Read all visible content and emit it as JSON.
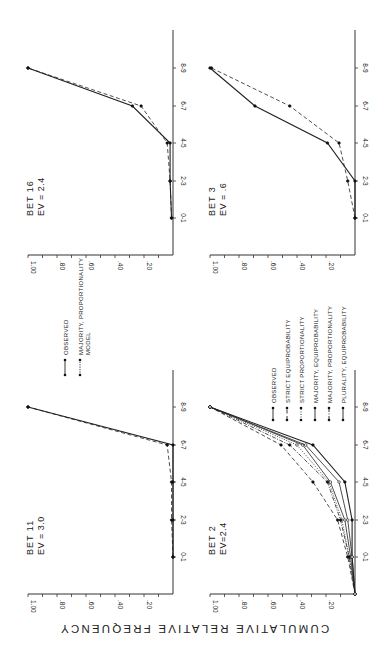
{
  "figure": {
    "ylabel": "CUMULATIVE  RELATIVE  FREQUENCY",
    "rotation": "figure rotated 90 degrees counter-clockwise on page"
  },
  "chart_data": [
    {
      "type": "line",
      "id": "bet11",
      "title": "BET 11",
      "subtitle": "EV = 3.0",
      "categories": [
        "0-1",
        "2-3",
        "4-5",
        "6-7",
        "8-9"
      ],
      "ylabel": "CUMULATIVE RELATIVE FREQUENCY",
      "yticks": [
        ".20",
        ".40",
        ".60",
        ".80",
        "1.00"
      ],
      "ylim": [
        0,
        1.0
      ],
      "legend": [
        "OBSERVED",
        "MAJORITY, PROPORTIONALITY MODEL"
      ],
      "series": [
        {
          "name": "OBSERVED",
          "style": "solid",
          "values": [
            0.0,
            0.0,
            0.0,
            0.0,
            1.0
          ]
        },
        {
          "name": "MAJORITY, PROPORTIONALITY MODEL",
          "style": "dashed",
          "values": [
            0.0,
            0.01,
            0.01,
            0.04,
            1.0
          ]
        }
      ]
    },
    {
      "type": "line",
      "id": "bet16",
      "title": "BET 16",
      "subtitle": "EV = 2.4",
      "categories": [
        "0-1",
        "2-3",
        "4-5",
        "6-7",
        "8-9"
      ],
      "yticks": [
        ".20",
        ".40",
        ".60",
        ".80",
        "1.00"
      ],
      "ylim": [
        0,
        1.0
      ],
      "series": [
        {
          "name": "OBSERVED",
          "style": "solid",
          "values": [
            0.01,
            0.02,
            0.02,
            0.28,
            1.0
          ]
        },
        {
          "name": "MAJORITY, PROPORTIONALITY MODEL",
          "style": "dashed",
          "values": [
            0.01,
            0.02,
            0.04,
            0.22,
            1.0
          ]
        }
      ]
    },
    {
      "type": "line",
      "id": "bet2",
      "title": "BET 2",
      "subtitle": "EV=2.4",
      "categories": [
        "",
        "0-1",
        "2-3",
        "4-5",
        "6-7",
        "8-9"
      ],
      "yticks": [
        ".20",
        ".40",
        ".60",
        ".80",
        "1.00"
      ],
      "ylim": [
        0,
        1.0
      ],
      "legend": [
        "OBSERVED",
        "STRICT EQUIPROBABILITY",
        "STRICT PROPORTIONALITY",
        "MAJORITY, EQUIPROBABILITY",
        "MAJORITY, PROPORTIONALITY",
        "PLURALITY, EQUIPROBABILITY"
      ],
      "series": [
        {
          "name": "OBSERVED",
          "style": "solid",
          "values": [
            0.0,
            0.02,
            0.02,
            0.07,
            0.29,
            1.0
          ]
        },
        {
          "name": "STRICT EQUIPROBABILITY",
          "style": "dashed",
          "values": [
            0.0,
            0.05,
            0.12,
            0.29,
            0.51,
            1.0
          ]
        },
        {
          "name": "STRICT PROPORTIONALITY",
          "style": "dotted",
          "values": [
            0.0,
            0.04,
            0.09,
            0.18,
            0.4,
            1.0
          ]
        },
        {
          "name": "MAJORITY, EQUIPROBABILITY",
          "style": "solid-open",
          "values": [
            0.0,
            0.03,
            0.07,
            0.17,
            0.36,
            1.0
          ]
        },
        {
          "name": "MAJORITY, PROPORTIONALITY",
          "style": "dash-dot",
          "values": [
            0.0,
            0.04,
            0.1,
            0.19,
            0.45,
            1.0
          ]
        },
        {
          "name": "PLURALITY, EQUIPROBABILITY",
          "style": "solid-open2",
          "values": [
            0.0,
            0.02,
            0.05,
            0.11,
            0.34,
            1.0
          ]
        }
      ]
    },
    {
      "type": "line",
      "id": "bet3",
      "title": "BET 3",
      "subtitle": "EV = .6",
      "categories": [
        "0-1",
        "2-3",
        "4-5",
        "6-7",
        "8-9"
      ],
      "yticks": [
        ".20",
        ".40",
        ".60",
        ".80",
        "1.00"
      ],
      "ylim": [
        0,
        1.0
      ],
      "series": [
        {
          "name": "OBSERVED",
          "style": "solid",
          "values": [
            0.0,
            0.0,
            0.19,
            0.69,
            1.0
          ]
        },
        {
          "name": "MAJORITY, PROPORTIONALITY MODEL",
          "style": "dashed",
          "values": [
            0.0,
            0.05,
            0.11,
            0.45,
            0.99
          ]
        }
      ]
    }
  ]
}
